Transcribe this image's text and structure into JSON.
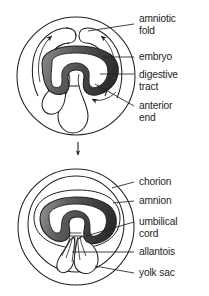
{
  "figure": {
    "panels": [
      {
        "id": "panel-upper",
        "stage_label": "early amniotic fold stage",
        "labels": [
          {
            "id": "amniotic-fold",
            "line1": "amniotic",
            "line2": "fold"
          },
          {
            "id": "embryo",
            "line1": "embryo",
            "line2": ""
          },
          {
            "id": "digestive-tract",
            "line1": "digestive",
            "line2": "tract"
          },
          {
            "id": "anterior-end",
            "line1": "anterior",
            "line2": "end"
          }
        ]
      },
      {
        "id": "panel-lower",
        "stage_label": "fused membrane stage",
        "labels": [
          {
            "id": "chorion",
            "line1": "chorion",
            "line2": ""
          },
          {
            "id": "amnion",
            "line1": "amnion",
            "line2": ""
          },
          {
            "id": "umbilical-cord",
            "line1": "umbilical",
            "line2": "cord"
          },
          {
            "id": "allantois",
            "line1": "allantois",
            "line2": ""
          },
          {
            "id": "yolk-sac",
            "line1": "yolk sac",
            "line2": ""
          }
        ]
      }
    ],
    "transition": {
      "arrow_direction": "down"
    },
    "colors": {
      "background": "#ffffff",
      "stroke": "#231f20",
      "text": "#231f20",
      "embryo_dark": "#3f3f40",
      "embryo_mid": "#5a5a5c",
      "embryo_light": "#8e8e90",
      "cavity_fill": "#ffffff"
    }
  }
}
